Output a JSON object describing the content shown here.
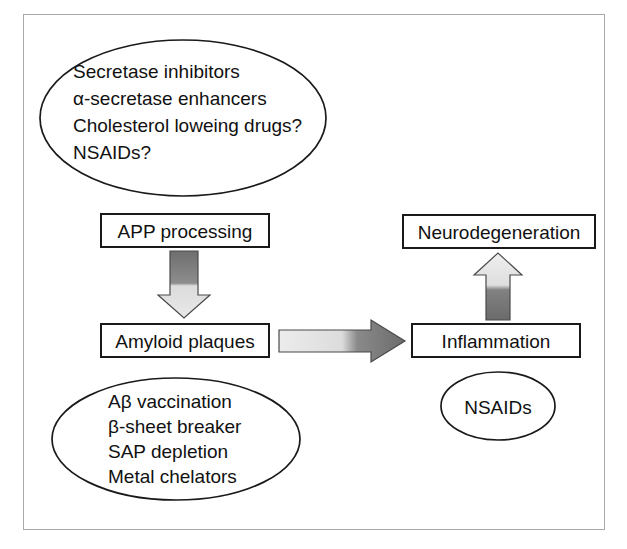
{
  "figure": {
    "frame_color": "#a9a9ad",
    "background": "#ffffff",
    "outline_color": "#1a1a1a"
  },
  "nodes": {
    "upper_ellipse": {
      "name": "secretase-therapies-ellipse",
      "lines": [
        "Secretase inhibitors",
        "α-secretase enhancers",
        "Cholesterol loweing drugs?",
        "NSAIDs?"
      ]
    },
    "lower_ellipse": {
      "name": "amyloid-therapies-ellipse",
      "lines": [
        "Aβ vaccination",
        "β-sheet breaker",
        "SAP depletion",
        "Metal chelators"
      ]
    },
    "nsaids_ellipse": {
      "name": "nsaids-ellipse",
      "lines": [
        "NSAIDs"
      ]
    },
    "app_processing_box": {
      "name": "app-processing-box",
      "label": "APP processing"
    },
    "amyloid_plaques_box": {
      "name": "amyloid-plaques-box",
      "label": "Amyloid plaques"
    },
    "inflammation_box": {
      "name": "inflammation-box",
      "label": "Inflammation"
    },
    "neurodegeneration_box": {
      "name": "neurodegeneration-box",
      "label": "Neurodegeneration"
    }
  },
  "arrows": {
    "app_to_plaques": {
      "name": "arrow-down-app-to-plaques",
      "direction": "down",
      "gradient_start": "#6e6e6e",
      "gradient_end": "#e2e2e2"
    },
    "plaques_to_inflammation": {
      "name": "arrow-right-plaques-to-inflammation",
      "direction": "right",
      "gradient_start": "#e8e8e8",
      "gradient_end": "#6b6b6b"
    },
    "inflammation_to_neurodegeneration": {
      "name": "arrow-up-inflammation-to-neurodegeneration",
      "direction": "up",
      "gradient_start": "#6b6b6b",
      "gradient_end": "#ededed"
    }
  }
}
